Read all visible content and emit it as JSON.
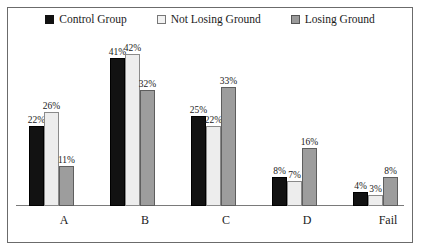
{
  "chart_data": {
    "type": "bar",
    "title": "",
    "subtitle": "",
    "xlabel": "",
    "ylabel": "",
    "ylim": [
      0,
      42
    ],
    "grid": false,
    "legend_position": "top-center",
    "categories": [
      "A",
      "B",
      "C",
      "D",
      "Fail"
    ],
    "series": [
      {
        "name": "Control Group",
        "color": "#121212",
        "values": [
          22,
          41,
          25,
          8,
          4
        ],
        "labels": [
          "22%",
          "41%",
          "25%",
          "8%",
          "4%"
        ]
      },
      {
        "name": "Not Losing Ground",
        "color": "#ededed",
        "values": [
          26,
          42,
          22,
          7,
          3
        ],
        "labels": [
          "26%",
          "42%",
          "22%",
          "7%",
          "3%"
        ]
      },
      {
        "name": "Losing Ground",
        "color": "#9d9d9d",
        "values": [
          11,
          32,
          33,
          16,
          8
        ],
        "labels": [
          "11%",
          "32%",
          "33%",
          "16%",
          "8%"
        ]
      }
    ]
  },
  "legend": {
    "items": [
      {
        "label": "Control Group"
      },
      {
        "label": "Not Losing Ground"
      },
      {
        "label": "Losing Ground"
      }
    ]
  },
  "axis": {
    "categories": [
      {
        "label": "A"
      },
      {
        "label": "B"
      },
      {
        "label": "C"
      },
      {
        "label": "D"
      },
      {
        "label": "Fail"
      }
    ]
  }
}
